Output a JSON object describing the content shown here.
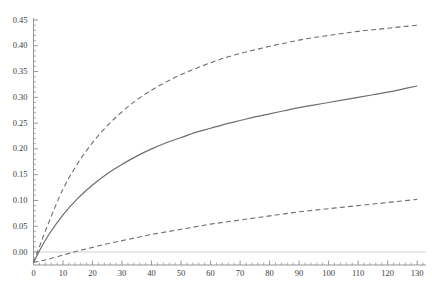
{
  "chart_data": {
    "type": "line",
    "title": "",
    "subtitle": "",
    "xlabel": "",
    "ylabel": "",
    "xlim": [
      0,
      133
    ],
    "ylim": [
      -0.025,
      0.46
    ],
    "grid": false,
    "legend": null,
    "axis_color": "#8a8a8a",
    "zero_line_color": "#c9c9c9",
    "xticks": [
      0,
      10,
      20,
      30,
      40,
      50,
      60,
      70,
      80,
      90,
      100,
      110,
      120,
      130
    ],
    "xtick_labels": [
      "0",
      "10",
      "20",
      "30",
      "40",
      "50",
      "60",
      "70",
      "80",
      "90",
      "100",
      "110",
      "120",
      "130"
    ],
    "yticks": [
      0.0,
      0.05,
      0.1,
      0.15,
      0.2,
      0.25,
      0.3,
      0.35,
      0.4,
      0.45
    ],
    "ytick_labels": [
      "0.00",
      "0.05",
      "0.10",
      "0.15",
      "0.20",
      "0.25",
      "0.30",
      "0.35",
      "0.40",
      "0.45"
    ],
    "x_minor_tick_step": 2,
    "y_minor_tick_step": 0.01,
    "x": [
      0,
      2,
      5,
      10,
      15,
      20,
      25,
      30,
      35,
      40,
      45,
      50,
      55,
      60,
      65,
      70,
      75,
      80,
      85,
      90,
      95,
      100,
      105,
      110,
      115,
      120,
      125,
      130
    ],
    "series": [
      {
        "name": "upper-band",
        "style": "dashed",
        "color": "#6e6e6e",
        "width": 1.1,
        "values": [
          -0.02,
          0.01,
          0.055,
          0.122,
          0.172,
          0.212,
          0.245,
          0.272,
          0.295,
          0.314,
          0.33,
          0.344,
          0.356,
          0.367,
          0.377,
          0.385,
          0.392,
          0.399,
          0.405,
          0.411,
          0.416,
          0.42,
          0.424,
          0.428,
          0.431,
          0.434,
          0.437,
          0.44
        ]
      },
      {
        "name": "mean-estimate",
        "style": "solid",
        "color": "#6e6e6e",
        "width": 1.2,
        "values": [
          -0.02,
          0.002,
          0.032,
          0.072,
          0.104,
          0.13,
          0.152,
          0.17,
          0.186,
          0.2,
          0.212,
          0.222,
          0.232,
          0.24,
          0.248,
          0.255,
          0.262,
          0.268,
          0.274,
          0.28,
          0.285,
          0.29,
          0.295,
          0.3,
          0.305,
          0.31,
          0.316,
          0.322
        ]
      },
      {
        "name": "lower-band",
        "style": "dashed",
        "color": "#6e6e6e",
        "width": 1.1,
        "values": [
          -0.02,
          -0.018,
          -0.014,
          -0.006,
          0.002,
          0.009,
          0.016,
          0.022,
          0.028,
          0.034,
          0.039,
          0.044,
          0.049,
          0.054,
          0.058,
          0.062,
          0.066,
          0.07,
          0.074,
          0.078,
          0.081,
          0.084,
          0.087,
          0.09,
          0.093,
          0.096,
          0.099,
          0.102
        ]
      }
    ]
  }
}
